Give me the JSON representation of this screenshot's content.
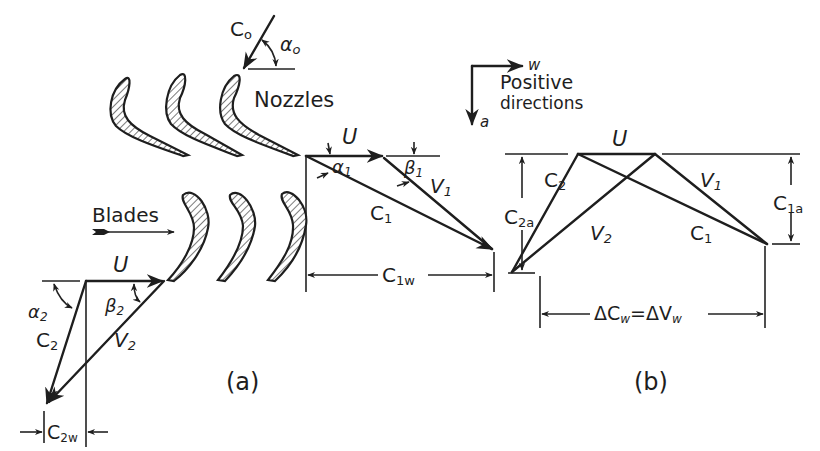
{
  "figure": {
    "panel_a": {
      "caption": "(a)",
      "labels": {
        "nozzles": "Nozzles",
        "blades": "Blades",
        "c0": "C",
        "c0_sub": "o",
        "alpha0": "α",
        "alpha0_sub": "o",
        "u_top": "U",
        "alpha1": "α",
        "alpha1_sub": "1",
        "beta1": "β",
        "beta1_sub": "1",
        "v1": "V",
        "v1_sub": "1",
        "c1": "C",
        "c1_sub": "1",
        "c1w": "C",
        "c1w_sub": "1w",
        "u_bottom": "U",
        "alpha2": "α",
        "alpha2_sub": "2",
        "beta2": "β",
        "beta2_sub": "2",
        "c2": "C",
        "c2_sub": "2",
        "v2": "V",
        "v2_sub": "2",
        "c2w": "C",
        "c2w_sub": "2w"
      }
    },
    "legend": {
      "w_axis": "w",
      "a_axis": "a",
      "line1": "Positive",
      "line2": "directions"
    },
    "panel_b": {
      "caption": "(b)",
      "labels": {
        "u": "U",
        "c2": "C",
        "c2_sub": "2",
        "c2a": "C",
        "c2a_sub": "2a",
        "v2": "V",
        "v2_sub": "2",
        "v1": "V",
        "v1_sub": "1",
        "c1": "C",
        "c1_sub": "1",
        "c1a": "C",
        "c1a_sub": "1a",
        "delta": "ΔC",
        "delta_sub1": "w",
        "eq": "=ΔV",
        "delta_sub2": "w"
      }
    },
    "colors": {
      "ink": "#1e1e1e",
      "paper": "#ffffff"
    }
  }
}
